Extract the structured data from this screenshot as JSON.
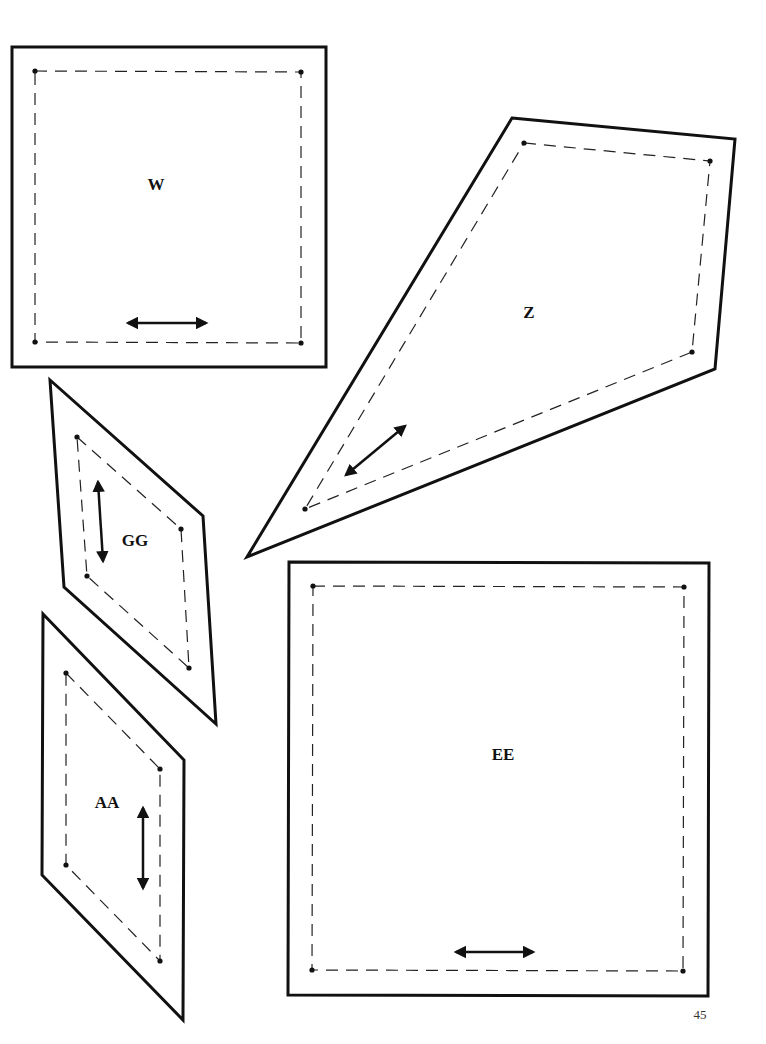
{
  "page": {
    "number": "45",
    "background": "#ffffff",
    "ink": "#111111"
  },
  "pieces": [
    {
      "id": "W",
      "label": "W",
      "label_pos": [
        156,
        190
      ],
      "outline": [
        [
          12,
          47
        ],
        [
          326,
          47
        ],
        [
          326,
          367
        ],
        [
          12,
          367
        ]
      ],
      "seam": [
        [
          35,
          71
        ],
        [
          301,
          72
        ],
        [
          301,
          343
        ],
        [
          35,
          342
        ]
      ],
      "grain": [
        [
          128,
          323
        ],
        [
          206,
          323
        ]
      ]
    },
    {
      "id": "Z",
      "label": "Z",
      "label_pos": [
        529,
        318
      ],
      "outline": [
        [
          512,
          118
        ],
        [
          735,
          139
        ],
        [
          715,
          369
        ],
        [
          247,
          557
        ]
      ],
      "seam": [
        [
          524,
          143
        ],
        [
          710,
          161
        ],
        [
          692,
          352
        ],
        [
          305,
          509
        ]
      ],
      "grain": [
        [
          346,
          475
        ],
        [
          405,
          426
        ]
      ]
    },
    {
      "id": "GG",
      "label": "GG",
      "label_pos": [
        135,
        546
      ],
      "outline": [
        [
          50,
          380
        ],
        [
          203,
          516
        ],
        [
          216,
          724
        ],
        [
          64,
          587
        ]
      ],
      "seam": [
        [
          77,
          437
        ],
        [
          181,
          529
        ],
        [
          189,
          668
        ],
        [
          87,
          576
        ]
      ],
      "grain": [
        [
          98,
          482
        ],
        [
          103,
          561
        ]
      ]
    },
    {
      "id": "AA",
      "label": "AA",
      "label_pos": [
        107,
        808
      ],
      "outline": [
        [
          43,
          614
        ],
        [
          184,
          760
        ],
        [
          183,
          1020
        ],
        [
          42,
          875
        ]
      ],
      "seam": [
        [
          66,
          673
        ],
        [
          160,
          769
        ],
        [
          160,
          961
        ],
        [
          66,
          865
        ]
      ],
      "grain": [
        [
          143,
          808
        ],
        [
          143,
          888
        ]
      ]
    },
    {
      "id": "EE",
      "label": "EE",
      "label_pos": [
        503,
        760
      ],
      "outline": [
        [
          289,
          562
        ],
        [
          709,
          563
        ],
        [
          708,
          996
        ],
        [
          288,
          995
        ]
      ],
      "seam": [
        [
          313,
          586
        ],
        [
          684,
          587
        ],
        [
          683,
          971
        ],
        [
          312,
          970
        ]
      ],
      "grain": [
        [
          456,
          952
        ],
        [
          533,
          952
        ]
      ]
    }
  ]
}
